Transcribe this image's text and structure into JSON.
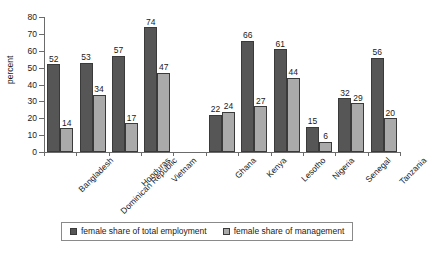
{
  "chart_data": {
    "type": "bar",
    "title": "",
    "subtitle": "",
    "xlabel": "",
    "ylabel": "percent",
    "ylim": [
      0,
      80
    ],
    "ytick_step": 10,
    "yticks": [
      0,
      10,
      20,
      30,
      40,
      50,
      60,
      70,
      80
    ],
    "grid": false,
    "legend_position": "bottom",
    "categories": [
      "Bangladesh",
      "Dominican Republic",
      "Honduras",
      "Vietnam",
      "",
      "Ghana",
      "Kenya",
      "Lesotho",
      "Nigeria",
      "Senegal",
      "Tanzania"
    ],
    "series": [
      {
        "name": "female share of total employment",
        "color": "#565656",
        "values": [
          52,
          53,
          57,
          74,
          null,
          22,
          66,
          61,
          15,
          32,
          56
        ]
      },
      {
        "name": "female share of management",
        "color": "#aaaaaa",
        "values": [
          14,
          34,
          17,
          47,
          null,
          24,
          27,
          44,
          6,
          29,
          20
        ]
      }
    ]
  },
  "legend": {
    "items": [
      {
        "label": "female share of total employment",
        "swatch": "dark-gray-swatch"
      },
      {
        "label": "female share of management",
        "swatch": "light-gray-swatch"
      }
    ]
  },
  "colors": {
    "series_total_employment": "#565656",
    "series_management": "#aaaaaa",
    "axis": "#6b6b6b",
    "text": "#1a1a1a",
    "background": "#ffffff"
  }
}
